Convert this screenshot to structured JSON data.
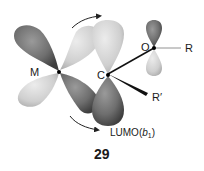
{
  "figure": {
    "number": "29",
    "atoms": {
      "metal": "M",
      "carbon": "C",
      "oxygen": "O",
      "substituent_r": "R",
      "substituent_r_prime": "R′"
    },
    "orbital_label": {
      "prefix": "LUMO(",
      "symmetry": "b",
      "subscript": "1",
      "suffix": ")"
    },
    "colors": {
      "dark_lobe": "#6e6e6e",
      "light_lobe": "#cfcfcf",
      "bond": "#111111",
      "arrow": "#222222"
    }
  }
}
